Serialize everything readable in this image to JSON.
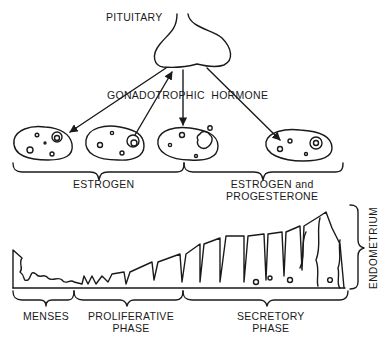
{
  "labels": {
    "pituitary": "PITUITARY",
    "hormone": "GONADOTROPHIC  HORMONE",
    "estrogen": "ESTROGEN",
    "estrogen_prog_line1": "ESTROGEN and",
    "estrogen_prog_line2": "PROGESTERONE",
    "endometrium": "ENDOMETRIUM",
    "menses": "MENSES",
    "proliferative_line1": "PROLIFERATIVE",
    "proliferative_line2": "PHASE",
    "secretory_line1": "SECRETORY",
    "secretory_line2": "PHASE"
  },
  "colors": {
    "ink": "#1a1a1a",
    "background": "#ffffff"
  }
}
